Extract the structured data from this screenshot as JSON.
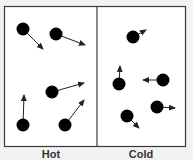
{
  "diagram": {
    "colors": {
      "background": "#f2f2f2",
      "panel": "#ffffff",
      "border": "#3a3a3a",
      "particle": "#000000",
      "arrow": "#222222",
      "label": "#333333"
    },
    "panels": [
      {
        "id": "hot",
        "label": "Hot",
        "particle_count": 5,
        "velocity_arrow_length": "long",
        "particles": [
          {
            "direction": "down-right"
          },
          {
            "direction": "right-slightly-down"
          },
          {
            "direction": "right-slightly-up"
          },
          {
            "direction": "up"
          },
          {
            "direction": "up-right"
          }
        ]
      },
      {
        "id": "cold",
        "label": "Cold",
        "particle_count": 5,
        "velocity_arrow_length": "short",
        "particles": [
          {
            "direction": "up-right"
          },
          {
            "direction": "up"
          },
          {
            "direction": "left"
          },
          {
            "direction": "down-right"
          },
          {
            "direction": "right"
          }
        ]
      }
    ]
  }
}
